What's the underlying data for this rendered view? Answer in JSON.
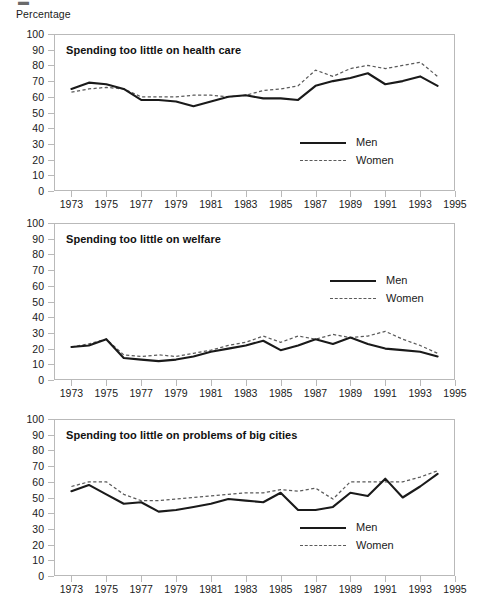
{
  "figure": {
    "top_glyph": "▬",
    "y_axis_title": "Percentage",
    "y_ticks": [
      "100",
      "90",
      "80",
      "70",
      "60",
      "50",
      "40",
      "30",
      "20",
      "10",
      "0"
    ],
    "x_ticks": [
      "1973",
      "1975",
      "1977",
      "1979",
      "1981",
      "1983",
      "1985",
      "1987",
      "1989",
      "1991",
      "1993",
      "1995"
    ],
    "legend": {
      "men_label": "Men",
      "women_label": "Women",
      "men_style": "solid-line",
      "women_style": "dashed-line"
    },
    "colors": {
      "men_line": "#1a1a1a",
      "women_line": "#5a5a5a",
      "frame": "#b9b9b9",
      "text": "#1a1a1a",
      "background": "#ffffff"
    }
  },
  "chart_data": [
    {
      "type": "line",
      "title": "Spending too little on health care",
      "xlabel": "",
      "ylabel": "Percentage",
      "ylim": [
        0,
        100
      ],
      "xlim": [
        1972,
        1995
      ],
      "grid": false,
      "legend_position": "lower-right",
      "x": [
        1973,
        1974,
        1975,
        1976,
        1977,
        1978,
        1979,
        1980,
        1981,
        1982,
        1983,
        1984,
        1985,
        1986,
        1987,
        1988,
        1989,
        1990,
        1991,
        1992,
        1993,
        1994
      ],
      "series": [
        {
          "name": "Men",
          "values": [
            65,
            69,
            68,
            65,
            58,
            58,
            57,
            54,
            57,
            60,
            61,
            59,
            59,
            58,
            67,
            70,
            72,
            75,
            68,
            70,
            73,
            67
          ]
        },
        {
          "name": "Women",
          "values": [
            63,
            65,
            66,
            65,
            60,
            60,
            60,
            61,
            61,
            60,
            61,
            64,
            65,
            67,
            77,
            73,
            78,
            80,
            78,
            80,
            82,
            73
          ]
        }
      ]
    },
    {
      "type": "line",
      "title": "Spending too little on welfare",
      "xlabel": "",
      "ylabel": "Percentage",
      "ylim": [
        0,
        100
      ],
      "xlim": [
        1972,
        1995
      ],
      "grid": false,
      "legend_position": "upper-right",
      "x": [
        1973,
        1974,
        1975,
        1976,
        1977,
        1978,
        1979,
        1980,
        1981,
        1982,
        1983,
        1984,
        1985,
        1986,
        1987,
        1988,
        1989,
        1990,
        1991,
        1992,
        1993,
        1994
      ],
      "series": [
        {
          "name": "Men",
          "values": [
            21,
            22,
            26,
            14,
            13,
            12,
            13,
            15,
            18,
            20,
            22,
            25,
            19,
            22,
            26,
            23,
            27,
            23,
            20,
            19,
            18,
            15
          ]
        },
        {
          "name": "Women",
          "values": [
            21,
            23,
            26,
            16,
            15,
            16,
            15,
            17,
            19,
            22,
            24,
            28,
            24,
            28,
            26,
            29,
            27,
            28,
            31,
            26,
            22,
            17
          ]
        }
      ]
    },
    {
      "type": "line",
      "title": "Spending too little on problems of big cities",
      "xlabel": "",
      "ylabel": "Percentage",
      "ylim": [
        0,
        100
      ],
      "xlim": [
        1972,
        1995
      ],
      "grid": false,
      "legend_position": "lower-right",
      "x": [
        1973,
        1974,
        1975,
        1976,
        1977,
        1978,
        1979,
        1980,
        1981,
        1982,
        1983,
        1984,
        1985,
        1986,
        1987,
        1988,
        1989,
        1990,
        1991,
        1992,
        1993,
        1994
      ],
      "series": [
        {
          "name": "Men",
          "values": [
            54,
            58,
            52,
            46,
            47,
            41,
            42,
            44,
            46,
            49,
            48,
            47,
            53,
            42,
            42,
            44,
            53,
            51,
            62,
            50,
            57,
            65,
            62
          ]
        },
        {
          "name": "Women",
          "values": [
            57,
            60,
            60,
            52,
            48,
            48,
            49,
            50,
            51,
            52,
            53,
            53,
            55,
            54,
            56,
            49,
            60,
            60,
            60,
            60,
            63,
            67,
            66
          ]
        }
      ]
    }
  ]
}
